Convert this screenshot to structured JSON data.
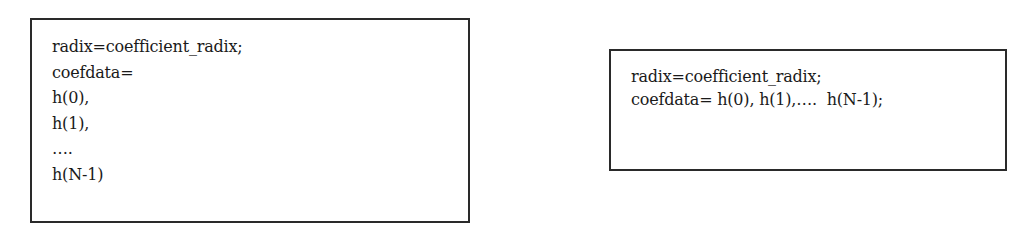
{
  "left_box": {
    "lines": [
      "radix=coefficient_radix;",
      "coefdata=",
      "h(0),",
      "h(1),",
      "….",
      "h(N-1)"
    ]
  },
  "right_box": {
    "lines": [
      "radix=coefficient_radix;",
      "coefdata= h(0), h(1),….  h(N-1);"
    ]
  }
}
